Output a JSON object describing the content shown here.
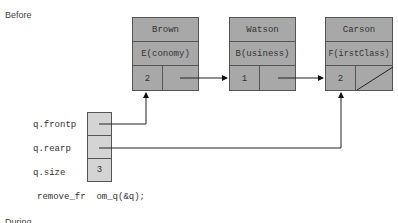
{
  "sections": {
    "before_label": "Before",
    "during_label": "During"
  },
  "nodes": [
    {
      "name": "Brown",
      "class": "E(conomy)",
      "count": "2",
      "next": "Watson"
    },
    {
      "name": "Watson",
      "class": "B(usiness)",
      "count": "1",
      "next": "Carson"
    },
    {
      "name": "Carson",
      "class": "F(irstClass)",
      "count": "2",
      "next": null
    }
  ],
  "queue": {
    "labels": {
      "frontp": "q.frontp",
      "rearp": "q.rearp",
      "size": "q.size"
    },
    "size_value": "3",
    "frontp_target": "Brown",
    "rearp_target": "Carson"
  },
  "code": {
    "call": "remove_fr  om_q(&q);"
  },
  "colors": {
    "node_fill": "#a8a8a8",
    "queue_fill": "#d4d4d4",
    "line": "#333333"
  }
}
